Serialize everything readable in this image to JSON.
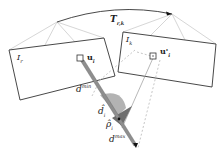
{
  "diagram": {
    "type": "two-view epipolar depth geometry",
    "transform_label": {
      "main": "T",
      "sub": "r,k"
    },
    "reference_frame": {
      "main": "I",
      "sub": "r"
    },
    "keyframe": {
      "main": "I",
      "sub": "k"
    },
    "pixel_ref": {
      "main": "u",
      "sub": "i"
    },
    "pixel_key": {
      "main": "u'",
      "sub": "i"
    },
    "depth_min": {
      "main": "d",
      "sub": "i",
      "sup": "min"
    },
    "depth_est": {
      "main": "d̂",
      "sub": "i"
    },
    "depth_inv": {
      "main": "ρ̂",
      "sub": "i"
    },
    "depth_max": {
      "main": "d",
      "sub": "i",
      "sup": "max"
    },
    "colors": {
      "frame_stroke": "#333333",
      "frustum_stroke": "#bbbbbb",
      "ray_fill": "#999999",
      "distribution_light": "#aaaaaa",
      "distribution_dark": "#666666",
      "epipolar_dashed": "#bbbbbb"
    }
  }
}
